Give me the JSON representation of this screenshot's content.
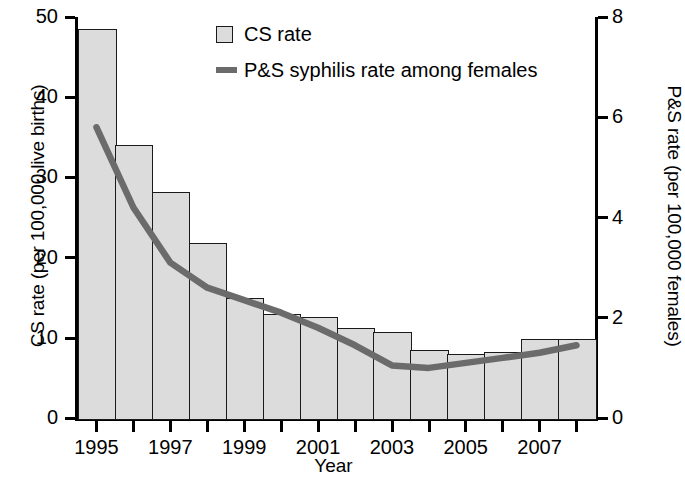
{
  "chart_data": {
    "type": "bar",
    "title": "",
    "xlabel": "Year",
    "ylabel": "CS rate (per 100,000 live births)",
    "ylabel_right": "P&S rate (per 100,000 females)",
    "categories": [
      "1995",
      "1996",
      "1997",
      "1998",
      "1999",
      "2000",
      "2001",
      "2002",
      "2003",
      "2004",
      "2005",
      "2006",
      "2007",
      "2008"
    ],
    "x_tick_labels": [
      "1995",
      "1997",
      "1999",
      "2001",
      "2003",
      "2005",
      "2007"
    ],
    "x_tick_label_years": [
      1995,
      1997,
      1999,
      2001,
      2003,
      2005,
      2007
    ],
    "ylim": [
      0,
      50
    ],
    "y_ticks": [
      0,
      10,
      20,
      30,
      40,
      50
    ],
    "ylim_right": [
      0,
      8
    ],
    "y_ticks_right": [
      0,
      2,
      4,
      6,
      8
    ],
    "grid": false,
    "legend_position": "top-center",
    "series": [
      {
        "name": "CS rate",
        "kind": "bar",
        "axis": "left",
        "color": "#dcdcdc",
        "edge_color": "#1a1a1a",
        "values": [
          48.5,
          34.0,
          28.2,
          21.8,
          15.0,
          13.0,
          12.6,
          11.2,
          10.7,
          8.5,
          8.0,
          8.2,
          9.8,
          9.8
        ]
      },
      {
        "name": "P&S syphilis rate among females",
        "kind": "line",
        "axis": "right",
        "color": "#6b6b6b",
        "values": [
          5.8,
          4.2,
          3.1,
          2.6,
          2.35,
          2.1,
          1.8,
          1.45,
          1.05,
          1.0,
          1.1,
          1.2,
          1.3,
          1.45
        ]
      }
    ]
  },
  "legend": {
    "items": [
      {
        "label": "CS rate",
        "marker": "bar-swatch"
      },
      {
        "label": "P&S syphilis rate among females",
        "marker": "line-swatch"
      }
    ]
  },
  "axes": {
    "left_title": "CS rate (per 100,000 live births)",
    "right_title": "P&S rate (per 100,000 females)",
    "bottom_title": "Year"
  },
  "colors": {
    "bar_fill": "#dcdcdc",
    "bar_edge": "#1a1a1a",
    "line": "#6b6b6b",
    "axis": "#000000",
    "background": "#ffffff"
  }
}
